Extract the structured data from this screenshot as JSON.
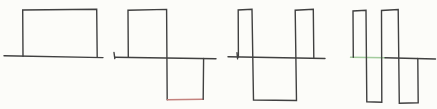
{
  "canvas": {
    "width": 437,
    "height": 109,
    "background": "#fcfcf9"
  },
  "style": {
    "stroke_color": "#404040",
    "stroke_width": 1.4,
    "red_accent": "#c4827e",
    "green_accent": "#a2cb9d"
  },
  "figures": [
    {
      "name": "waveform-1-single-positive-pulse",
      "segments": [
        {
          "part": "baseline",
          "color": "#404040",
          "points": [
            [
              4,
              55.8
            ],
            [
              103,
              57.6
            ]
          ]
        },
        {
          "part": "pulse-outline",
          "color": "#404040",
          "points": [
            [
              23,
              56.3
            ],
            [
              22.7,
              10
            ],
            [
              96.7,
              9.2
            ],
            [
              97.2,
              57.2
            ]
          ]
        }
      ]
    },
    {
      "name": "waveform-2-positive-then-negative-pulse",
      "segments": [
        {
          "part": "start-tick",
          "color": "#404040",
          "points": [
            [
              114,
              52.5
            ],
            [
              114.8,
              58.6
            ]
          ]
        },
        {
          "part": "baseline",
          "color": "#404040",
          "points": [
            [
              115,
              57.2
            ],
            [
              216,
              58.8
            ]
          ]
        },
        {
          "part": "outline",
          "color": "#404040",
          "points": [
            [
              128.3,
              57.3
            ],
            [
              128,
              10.2
            ],
            [
              166.6,
              9.4
            ],
            [
              167.2,
              99.8
            ]
          ]
        },
        {
          "part": "bottom-edge-red",
          "color": "#c4827e",
          "points": [
            [
              167.2,
              99.8
            ],
            [
              203.2,
              99.2
            ]
          ]
        },
        {
          "part": "right-edge",
          "color": "#404040",
          "points": [
            [
              203.2,
              99.2
            ],
            [
              203.6,
              58.5
            ]
          ]
        }
      ]
    },
    {
      "name": "waveform-3-positive-negative-positive",
      "segments": [
        {
          "part": "start-tick",
          "color": "#404040",
          "points": [
            [
              237,
              52.8
            ],
            [
              237.6,
              58.9
            ]
          ]
        },
        {
          "part": "baseline",
          "color": "#404040",
          "points": [
            [
              228,
              56.8
            ],
            [
              325,
              58.5
            ]
          ]
        },
        {
          "part": "outline",
          "color": "#404040",
          "points": [
            [
              238.4,
              57
            ],
            [
              238.2,
              10
            ],
            [
              252,
              9.3
            ],
            [
              253.5,
              100
            ],
            [
              296.5,
              100.5
            ],
            [
              295.2,
              10.2
            ],
            [
              313.3,
              9.2
            ],
            [
              313.8,
              57.8
            ]
          ]
        }
      ]
    },
    {
      "name": "waveform-4-two-cycle-square-wave",
      "segments": [
        {
          "part": "baseline-green",
          "color": "#a2cb9d",
          "points": [
            [
              350.5,
              57.3
            ],
            [
              385,
              57.8
            ]
          ]
        },
        {
          "part": "baseline",
          "color": "#404040",
          "points": [
            [
              385,
              57.8
            ],
            [
              435.5,
              59
            ]
          ]
        },
        {
          "part": "outline",
          "color": "#404040",
          "points": [
            [
              353.3,
              57.3
            ],
            [
              353,
              11
            ],
            [
              366,
              10.3
            ],
            [
              366.8,
              101.8
            ],
            [
              381.8,
              102.2
            ],
            [
              381.5,
              10.5
            ],
            [
              398.2,
              9.5
            ],
            [
              399.3,
              103.2
            ],
            [
              418.2,
              102.8
            ],
            [
              417.8,
              58.5
            ]
          ]
        }
      ]
    }
  ]
}
